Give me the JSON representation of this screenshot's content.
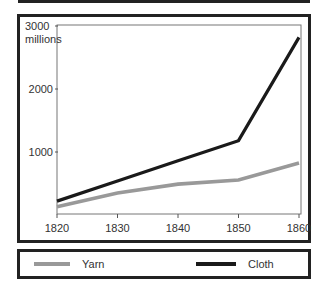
{
  "chart_data": {
    "type": "line",
    "title": "",
    "xlabel": "",
    "ylabel": "millions",
    "x": [
      1820,
      1830,
      1840,
      1850,
      1860
    ],
    "xticks": [
      "1820",
      "1830",
      "1840",
      "1850",
      "1860"
    ],
    "yticks": [
      "1000",
      "2000",
      "3000"
    ],
    "ylim": [
      0,
      3000
    ],
    "xlim": [
      1820,
      1860
    ],
    "grid": false,
    "legend_position": "bottom",
    "series": [
      {
        "name": "Yarn",
        "color": "#999999",
        "values": [
          130,
          350,
          490,
          555,
          825
        ]
      },
      {
        "name": "Cloth",
        "color": "#1a1a1a",
        "values": [
          220,
          540,
          860,
          1180,
          2820
        ]
      }
    ]
  },
  "axis": {
    "y_unit_top": "3000",
    "y_unit_label": "millions",
    "y_mid": "2000",
    "y_low": "1000"
  },
  "legend": {
    "yarn_label": "Yarn",
    "cloth_label": "Cloth"
  }
}
